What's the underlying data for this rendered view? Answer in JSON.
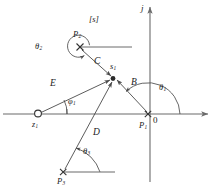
{
  "figure": {
    "title_label": "[s]",
    "axis": {
      "imaginary_label": "j",
      "origin_label": "0"
    },
    "points": [
      {
        "id": "p2",
        "label": "P",
        "sub": "2",
        "kind": "pole",
        "marker": "x",
        "x": 80,
        "y": 47
      },
      {
        "id": "s1",
        "label": "s",
        "sub": "1",
        "kind": "test-point",
        "marker": "dot",
        "x": 113,
        "y": 78
      },
      {
        "id": "z1",
        "label": "z",
        "sub": "1",
        "kind": "zero",
        "marker": "o",
        "x": 38,
        "y": 114
      },
      {
        "id": "p1",
        "label": "P",
        "sub": "1",
        "kind": "pole",
        "marker": "x",
        "x": 148,
        "y": 114
      },
      {
        "id": "p3",
        "label": "P",
        "sub": "3",
        "kind": "pole",
        "marker": "x",
        "x": 63,
        "y": 172
      }
    ],
    "vectors": [
      {
        "id": "B",
        "label": "B",
        "from": "p1",
        "to": "s1"
      },
      {
        "id": "C",
        "label": "C",
        "from": "p2",
        "to": "s1"
      },
      {
        "id": "D",
        "label": "D",
        "from": "p3",
        "to": "s1"
      },
      {
        "id": "E",
        "label": "E",
        "from": "z1",
        "to": "s1"
      }
    ],
    "angles": [
      {
        "id": "theta1",
        "label": "θ",
        "sub": "1"
      },
      {
        "id": "theta2",
        "label": "θ",
        "sub": "2"
      },
      {
        "id": "theta3",
        "label": "θ",
        "sub": "3"
      },
      {
        "id": "phi1",
        "label": "φ",
        "sub": "1"
      }
    ],
    "colors": {
      "stroke": "#4a4a4a",
      "axis": "#6b6b6b",
      "text": "#1a1a1a",
      "background": "#ffffff"
    }
  }
}
